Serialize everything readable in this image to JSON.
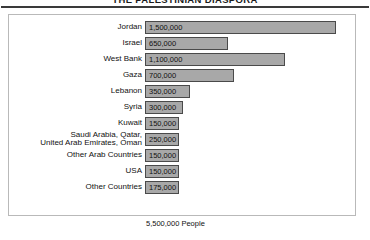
{
  "chart_data": {
    "type": "bar",
    "orientation": "horizontal",
    "title": "THE PALESTINIAN DIASPORA",
    "xlabel": "",
    "ylabel": "",
    "grid": false,
    "legend": null,
    "xlim": [
      0,
      1500000
    ],
    "categories": [
      "Jordan",
      "Israel",
      "West Bank",
      "Gaza",
      "Lebanon",
      "Syria",
      "Kuwait",
      "Saudi Arabia, Qatar, United Arab Emirates, Oman",
      "Other Arab Countries",
      "USA",
      "Other Countries"
    ],
    "values": [
      1500000,
      650000,
      1100000,
      700000,
      350000,
      300000,
      150000,
      250000,
      150000,
      150000,
      175000
    ],
    "value_labels": [
      "1,500,000",
      "650,000",
      "1,100,000",
      "700,000",
      "350,000",
      "300,000",
      "150,000",
      "250,000",
      "150,000",
      "150,000",
      "175,000"
    ],
    "total_label": "5,500,000 People",
    "total_value": 5500000,
    "bar_fill_color": "#a8a8a8",
    "bar_border_color": "#4a4a4a",
    "frame_color": "#b9b9b9",
    "rule_color": "#3a3a3a"
  }
}
